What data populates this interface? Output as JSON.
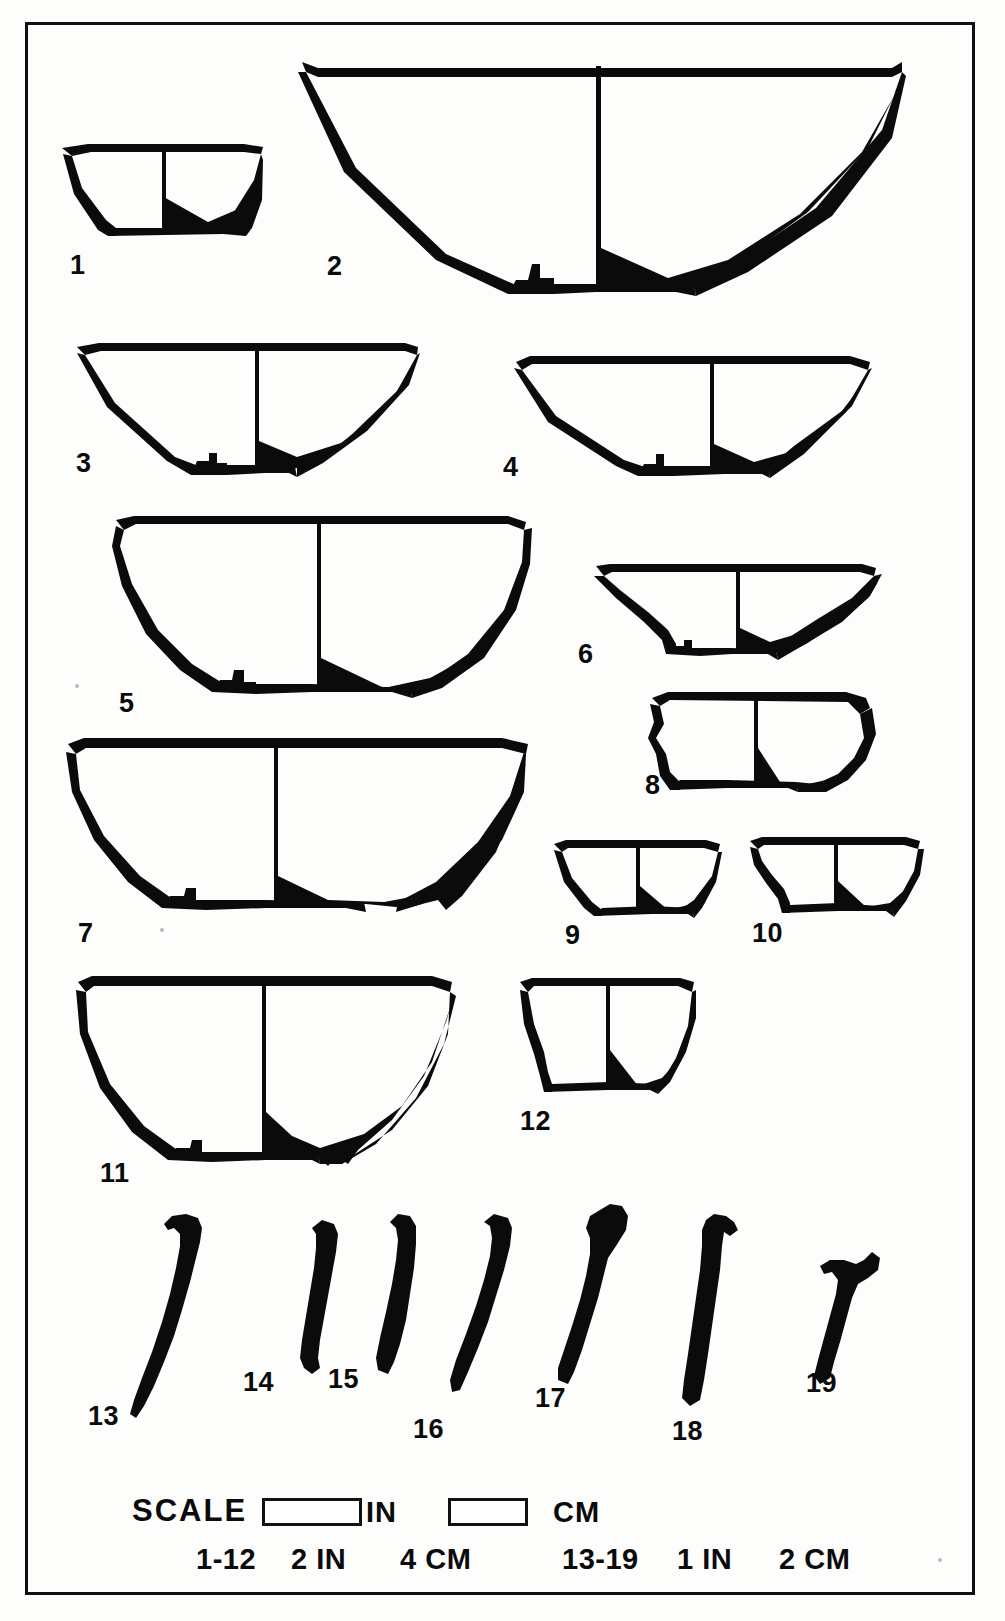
{
  "plate": {
    "kind": "archaeological-pottery-profile-plate",
    "frame_color": "#111111",
    "ink_color": "#0b0b0b",
    "paper_color": "#fdfdfb",
    "vessel_count": 19
  },
  "figures": [
    {
      "id": 1,
      "label": "1",
      "type": "bowl",
      "desc": "small flaring bowl, flat base"
    },
    {
      "id": 2,
      "label": "2",
      "type": "bowl",
      "desc": "large conical bowl, disc base"
    },
    {
      "id": 3,
      "label": "3",
      "type": "bowl",
      "desc": "shallow conical bowl, ring base"
    },
    {
      "id": 4,
      "label": "4",
      "type": "bowl",
      "desc": "shallow conical bowl, low foot"
    },
    {
      "id": 5,
      "label": "5",
      "type": "bowl",
      "desc": "deep rounded hemispherical bowl, ring base"
    },
    {
      "id": 6,
      "label": "6",
      "type": "bowl",
      "desc": "carinated bowl with pedestal foot"
    },
    {
      "id": 7,
      "label": "7",
      "type": "bowl",
      "desc": "large deep rounded bowl, flat base"
    },
    {
      "id": 8,
      "label": "8",
      "type": "cup",
      "desc": "straight-sided cup, flat base"
    },
    {
      "id": 9,
      "label": "9",
      "type": "cup",
      "desc": "small flaring cup"
    },
    {
      "id": 10,
      "label": "10",
      "type": "cup",
      "desc": "small cup with concave wall"
    },
    {
      "id": 11,
      "label": "11",
      "type": "bowl",
      "desc": "large deep rounded bowl, ring base"
    },
    {
      "id": 12,
      "label": "12",
      "type": "cup",
      "desc": "small deep cup, flat base"
    },
    {
      "id": 13,
      "label": "13",
      "type": "sherd",
      "desc": "rim / wall sherd profile"
    },
    {
      "id": 14,
      "label": "14",
      "type": "sherd",
      "desc": "rim / wall sherd profile"
    },
    {
      "id": 15,
      "label": "15",
      "type": "sherd",
      "desc": "rim / wall sherd profile"
    },
    {
      "id": 16,
      "label": "16",
      "type": "sherd",
      "desc": "rim / wall sherd profile"
    },
    {
      "id": 17,
      "label": "17",
      "type": "sherd",
      "desc": "rim / wall sherd profile"
    },
    {
      "id": 18,
      "label": "18",
      "type": "sherd",
      "desc": "rim / wall sherd profile"
    },
    {
      "id": 19,
      "label": "19",
      "type": "sherd",
      "desc": "short rim sherd profile"
    }
  ],
  "legend": {
    "title": "SCALE",
    "bar_in_label": "IN",
    "bar_cm_label": "CM",
    "row2": {
      "group_a_range": "1-12",
      "group_a_in": "2 IN",
      "group_a_cm": "4 CM",
      "group_b_range": "13-19",
      "group_b_in": "1 IN",
      "group_b_cm": "2 CM"
    }
  }
}
